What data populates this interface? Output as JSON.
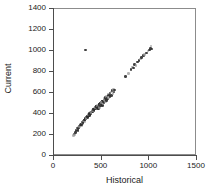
{
  "chart_data": {
    "type": "scatter",
    "title": "",
    "xlabel": "Historical",
    "ylabel": "Current",
    "xlim": [
      0,
      1500
    ],
    "ylim": [
      0,
      1400
    ],
    "xticks": [
      0,
      500,
      1000,
      1500
    ],
    "yticks": [
      0,
      200,
      400,
      600,
      800,
      1000,
      1200,
      1400
    ],
    "grid": false,
    "legend": null,
    "marker": {
      "shape": "circle",
      "color": "#2b2b2b",
      "light_color": "#9a9a9a",
      "size_px": 2.6
    },
    "annotations": [
      {
        "text": "outlier point well above the main trend",
        "x": 340,
        "y": 1000
      }
    ],
    "series": [
      {
        "name": "observations",
        "points": [
          [
            215,
            185
          ],
          [
            222,
            200
          ],
          [
            228,
            195
          ],
          [
            236,
            215
          ],
          [
            243,
            228
          ],
          [
            250,
            240
          ],
          [
            256,
            252
          ],
          [
            262,
            235
          ],
          [
            268,
            262
          ],
          [
            274,
            258
          ],
          [
            280,
            275
          ],
          [
            286,
            288
          ],
          [
            292,
            296
          ],
          [
            298,
            283
          ],
          [
            303,
            305
          ],
          [
            309,
            312
          ],
          [
            314,
            300
          ],
          [
            320,
            322
          ],
          [
            326,
            330
          ],
          [
            331,
            318
          ],
          [
            337,
            340
          ],
          [
            342,
            352
          ],
          [
            348,
            345
          ],
          [
            353,
            360
          ],
          [
            359,
            368
          ],
          [
            364,
            356
          ],
          [
            370,
            378
          ],
          [
            375,
            386
          ],
          [
            381,
            374
          ],
          [
            386,
            395
          ],
          [
            392,
            402
          ],
          [
            397,
            390
          ],
          [
            403,
            410
          ],
          [
            408,
            420
          ],
          [
            413,
            408
          ],
          [
            419,
            428
          ],
          [
            424,
            436
          ],
          [
            430,
            424
          ],
          [
            435,
            444
          ],
          [
            440,
            452
          ],
          [
            446,
            440
          ],
          [
            451,
            458
          ],
          [
            456,
            466
          ],
          [
            462,
            454
          ],
          [
            467,
            470
          ],
          [
            472,
            462
          ],
          [
            478,
            448
          ],
          [
            483,
            478
          ],
          [
            488,
            486
          ],
          [
            494,
            474
          ],
          [
            499,
            492
          ],
          [
            505,
            500
          ],
          [
            510,
            488
          ],
          [
            516,
            508
          ],
          [
            521,
            516
          ],
          [
            527,
            504
          ],
          [
            533,
            524
          ],
          [
            540,
            540
          ],
          [
            546,
            528
          ],
          [
            553,
            548
          ],
          [
            560,
            556
          ],
          [
            567,
            544
          ],
          [
            575,
            565
          ],
          [
            583,
            580
          ],
          [
            591,
            572
          ],
          [
            600,
            590
          ],
          [
            610,
            600
          ],
          [
            620,
            612
          ],
          [
            633,
            625
          ],
          [
            645,
            618
          ],
          [
            248,
            238
          ],
          [
            255,
            246
          ],
          [
            263,
            254
          ],
          [
            271,
            266
          ],
          [
            279,
            272
          ],
          [
            288,
            284
          ],
          [
            296,
            292
          ],
          [
            305,
            304
          ],
          [
            313,
            310
          ],
          [
            322,
            324
          ],
          [
            330,
            332
          ],
          [
            339,
            344
          ],
          [
            347,
            350
          ],
          [
            356,
            362
          ],
          [
            364,
            370
          ],
          [
            373,
            382
          ],
          [
            381,
            388
          ],
          [
            390,
            400
          ],
          [
            398,
            406
          ],
          [
            407,
            418
          ],
          [
            415,
            424
          ],
          [
            424,
            432
          ],
          [
            432,
            438
          ],
          [
            441,
            450
          ],
          [
            449,
            456
          ],
          [
            458,
            462
          ],
          [
            466,
            468
          ],
          [
            475,
            452
          ],
          [
            483,
            480
          ],
          [
            492,
            486
          ],
          [
            500,
            492
          ],
          [
            509,
            498
          ],
          [
            517,
            470
          ],
          [
            526,
            512
          ],
          [
            534,
            518
          ],
          [
            470,
            440
          ],
          [
            480,
            445
          ],
          [
            490,
            455
          ],
          [
            500,
            465
          ],
          [
            512,
            475
          ],
          [
            523,
            485
          ],
          [
            535,
            498
          ],
          [
            548,
            510
          ],
          [
            560,
            520
          ],
          [
            572,
            532
          ],
          [
            585,
            545
          ],
          [
            598,
            556
          ],
          [
            612,
            568
          ],
          [
            628,
            585
          ],
          [
            640,
            600
          ],
          [
            760,
            750
          ],
          [
            790,
            775
          ],
          [
            818,
            812
          ],
          [
            832,
            838
          ],
          [
            845,
            828
          ],
          [
            858,
            862
          ],
          [
            872,
            855
          ],
          [
            888,
            885
          ],
          [
            900,
            900
          ],
          [
            915,
            915
          ],
          [
            930,
            928
          ],
          [
            948,
            945
          ],
          [
            962,
            958
          ],
          [
            980,
            972
          ],
          [
            995,
            990
          ],
          [
            1010,
            1000
          ],
          [
            1022,
            1012
          ],
          [
            1030,
            1038
          ],
          [
            1040,
            1010
          ],
          [
            340,
            1000
          ]
        ]
      }
    ]
  }
}
